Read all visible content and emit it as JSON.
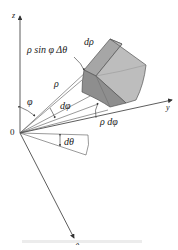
{
  "figure": {
    "type": "spherical-coordinates-volume-element",
    "axes": {
      "z_label": "z",
      "y_label": "y",
      "x_label": "x",
      "origin_label": "0"
    },
    "labels": {
      "arc_theta": "ρ sin φ Δθ",
      "d_rho": "dρ",
      "rho": "ρ",
      "phi": "φ",
      "d_phi": "dφ",
      "rho_d_phi": "ρ dφ",
      "d_theta": "dθ"
    },
    "colors": {
      "axis": "#333333",
      "box_front": "#8f8f8f",
      "box_side": "#b9b9b9",
      "box_top": "#a6a6a6",
      "box_edge": "#555555",
      "text": "#222222"
    }
  }
}
